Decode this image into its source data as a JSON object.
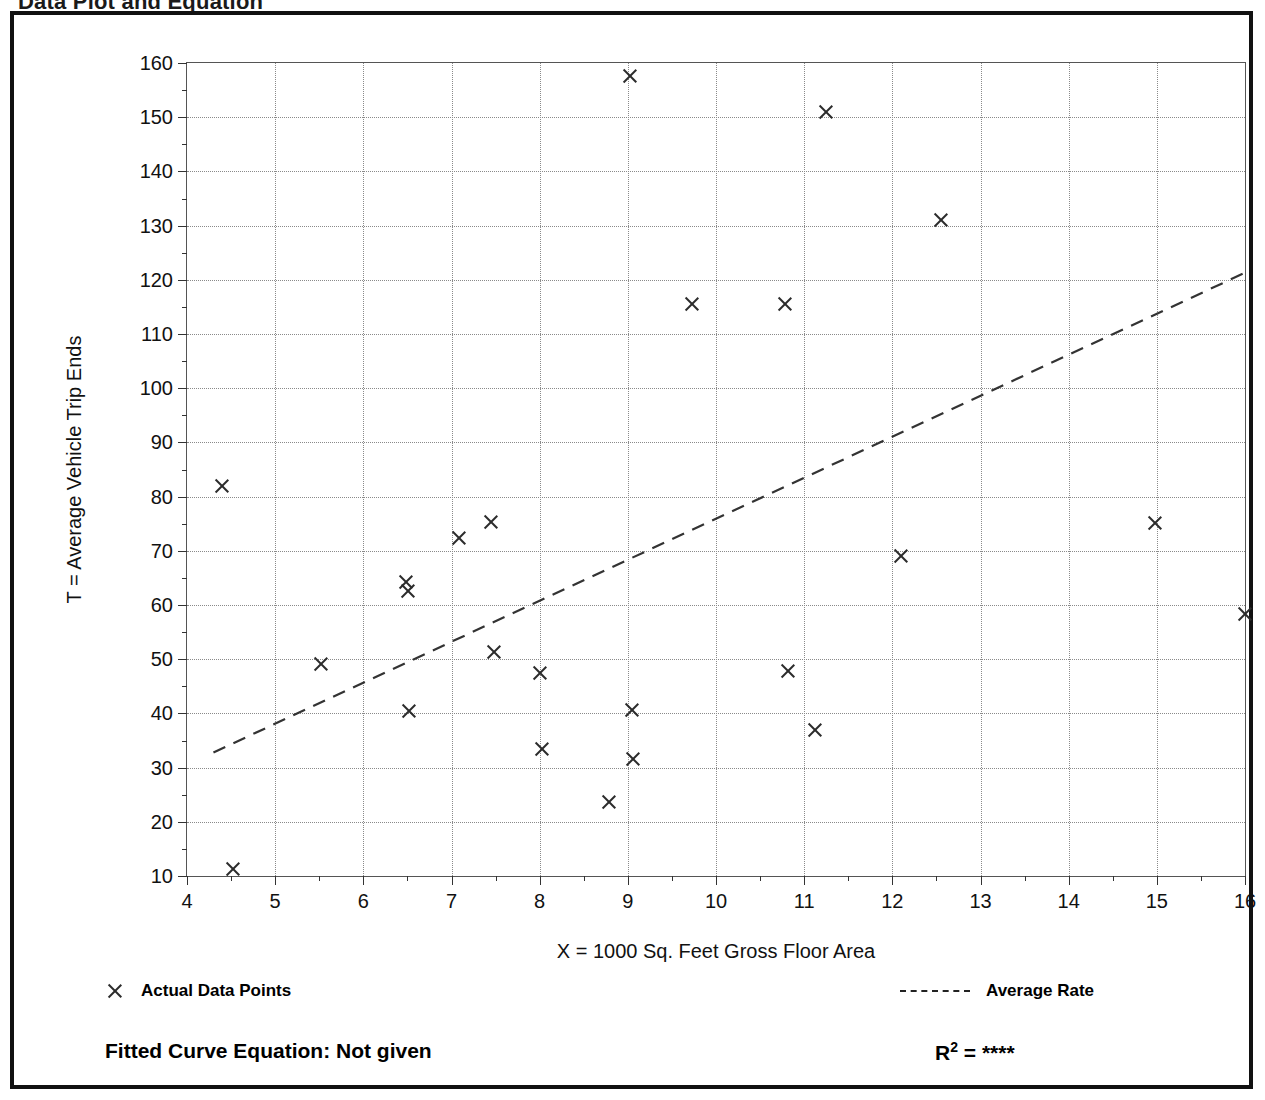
{
  "page": {
    "title": "Data Plot and Equation"
  },
  "legend": {
    "points_label": "Actual Data Points",
    "rate_label": "Average Rate",
    "point_marker_icon": "x-marker-icon",
    "rate_line_icon": "dashed-line-icon"
  },
  "footer": {
    "equation_label": "Fitted Curve Equation:  Not given",
    "r2_prefix": "R",
    "r2_sup": "2",
    "r2_eq": " = ",
    "r2_value": "****",
    "ghost_text": "Fitted Curve Equation:  Not given"
  },
  "chart_data": {
    "type": "scatter",
    "title": "Data Plot and Equation",
    "xlabel": "X = 1000 Sq. Feet Gross Floor Area",
    "ylabel": "T = Average Vehicle Trip Ends",
    "xlim": [
      4,
      16
    ],
    "ylim": [
      10,
      160
    ],
    "xticks": [
      4,
      5,
      6,
      7,
      8,
      9,
      10,
      11,
      12,
      13,
      14,
      15,
      16
    ],
    "yticks": [
      10,
      20,
      30,
      40,
      50,
      60,
      70,
      80,
      90,
      100,
      110,
      120,
      130,
      140,
      150,
      160
    ],
    "x_minor_step": 0.5,
    "y_minor_step": 5,
    "grid": true,
    "legend_position": "below-axes",
    "series": [
      {
        "name": "Actual Data Points",
        "marker": "x",
        "points": [
          {
            "x": 4.4,
            "y": 82.0
          },
          {
            "x": 4.52,
            "y": 11.2
          },
          {
            "x": 5.52,
            "y": 49.2
          },
          {
            "x": 6.48,
            "y": 64.3
          },
          {
            "x": 6.5,
            "y": 62.6
          },
          {
            "x": 6.52,
            "y": 40.4
          },
          {
            "x": 7.08,
            "y": 72.3
          },
          {
            "x": 7.45,
            "y": 75.4
          },
          {
            "x": 7.48,
            "y": 51.4
          },
          {
            "x": 8.0,
            "y": 47.5
          },
          {
            "x": 8.02,
            "y": 33.5
          },
          {
            "x": 8.78,
            "y": 23.6
          },
          {
            "x": 9.02,
            "y": 157.6
          },
          {
            "x": 9.05,
            "y": 40.6
          },
          {
            "x": 9.06,
            "y": 31.6
          },
          {
            "x": 9.72,
            "y": 115.5
          },
          {
            "x": 10.78,
            "y": 115.6
          },
          {
            "x": 10.82,
            "y": 47.8
          },
          {
            "x": 11.12,
            "y": 37.0
          },
          {
            "x": 11.25,
            "y": 151.0
          },
          {
            "x": 12.1,
            "y": 69.0
          },
          {
            "x": 12.55,
            "y": 131.0
          },
          {
            "x": 14.98,
            "y": 75.2
          },
          {
            "x": 16.0,
            "y": 58.3
          }
        ]
      },
      {
        "name": "Average Rate",
        "style": "dashed",
        "line": [
          {
            "x": 4.3,
            "y": 32.8
          },
          {
            "x": 16.0,
            "y": 121.3
          }
        ]
      }
    ]
  }
}
